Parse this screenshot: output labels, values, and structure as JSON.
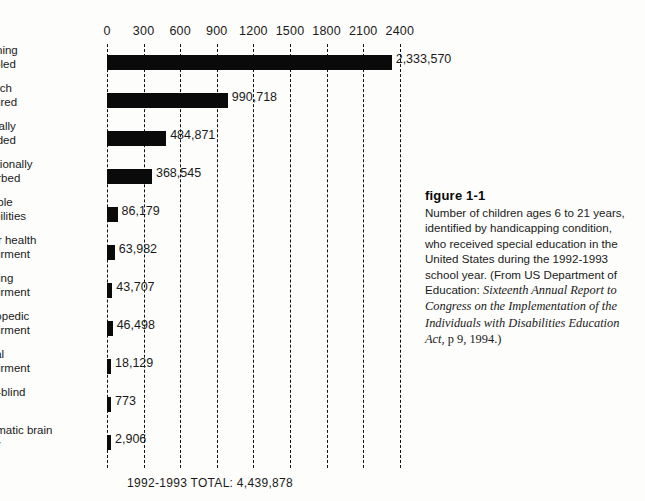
{
  "chart_data": {
    "type": "bar",
    "orientation": "horizontal",
    "title": "",
    "xlabel": "",
    "ylabel": "",
    "xlim": [
      0,
      2400
    ],
    "grid": true,
    "legend": false,
    "unit_note": "axis values in thousands",
    "ticks": [
      "0",
      "300",
      "600",
      "900",
      "1200",
      "1500",
      "1800",
      "2100",
      "2400"
    ],
    "tick_values": [
      0,
      300,
      600,
      900,
      1200,
      1500,
      1800,
      2100,
      2400
    ],
    "categories": [
      "Learning disabled",
      "Speech impaired",
      "Mentally retarded",
      "Emotionally disturbed",
      "Multiple disabilities",
      "Other health impairment",
      "Hearing impairment",
      "Orthopedic impairment",
      "Visual impairment",
      "Deaf-blind",
      "Traumatic brain injury"
    ],
    "values": [
      2333570,
      990718,
      484871,
      368545,
      86179,
      63982,
      43707,
      46498,
      18129,
      773,
      2906
    ],
    "value_labels": [
      "2,333,570",
      "990,718",
      "484,871",
      "368,545",
      "86,179",
      "63,982",
      "43,707",
      "46,498",
      "18,129",
      "773",
      "2,906"
    ],
    "bars": [
      {
        "label_line1": "Learning",
        "label_line2": "disabled",
        "value": 2333570,
        "value_label": "2,333,570",
        "plot_units": 2333.57
      },
      {
        "label_line1": "Speech",
        "label_line2": "impaired",
        "value": 990718,
        "value_label": "990,718",
        "plot_units": 990.718
      },
      {
        "label_line1": "Mentally",
        "label_line2": "retarded",
        "value": 484871,
        "value_label": "484,871",
        "plot_units": 484.871
      },
      {
        "label_line1": "Emotionally",
        "label_line2": "disturbed",
        "value": 368545,
        "value_label": "368,545",
        "plot_units": 368.545
      },
      {
        "label_line1": "Multiple",
        "label_line2": "disabilities",
        "value": 86179,
        "value_label": "86,179",
        "plot_units": 86.179
      },
      {
        "label_line1": "Other health",
        "label_line2": "impairment",
        "value": 63982,
        "value_label": "63,982",
        "plot_units": 63.982
      },
      {
        "label_line1": "Hearing",
        "label_line2": "impairment",
        "value": 43707,
        "value_label": "43,707",
        "plot_units": 43.707
      },
      {
        "label_line1": "Orthopedic",
        "label_line2": "impairment",
        "value": 46498,
        "value_label": "46,498",
        "plot_units": 46.498
      },
      {
        "label_line1": "Visual",
        "label_line2": "impairment",
        "value": 18129,
        "value_label": "18,129",
        "plot_units": 18.129
      },
      {
        "label_line1": "Deaf-blind",
        "label_line2": "",
        "value": 773,
        "value_label": "773",
        "plot_units": 0.773
      },
      {
        "label_line1": "Traumatic brain",
        "label_line2": "injury",
        "value": 2906,
        "value_label": "2,906",
        "plot_units": 2.906
      }
    ],
    "bar_color": "#0a0a0a",
    "gridline_color": "#111111",
    "total_label": "1992-1993 TOTAL:  4,439,878",
    "total_value": 4439878
  },
  "caption": {
    "figure_number": "figure 1-1",
    "body_before_italic": "Number of children ages 6 to 21 years, identified by handicapping condition, who received special education in the United States during the 1992-1993 school year. (From US Department of Education: ",
    "italic_title": "Sixteenth Annual Report to Congress on the Implementation of the Individuals with Disabilities Education Act,",
    "body_after_italic": " p 9, 1994.)"
  }
}
